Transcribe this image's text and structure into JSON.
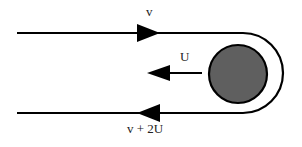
{
  "diagram": {
    "type": "flow-around-moving-body",
    "labels": {
      "top_velocity": "v",
      "body_velocity": "U",
      "bottom_velocity": "v + 2U"
    },
    "colors": {
      "stroke": "#000000",
      "body_fill": "#5f5f5f",
      "background": "#ffffff"
    },
    "elements": [
      {
        "name": "incoming-stream",
        "direction": "right",
        "label": "v"
      },
      {
        "name": "moving-body",
        "shape": "circle",
        "direction": "left",
        "label": "U"
      },
      {
        "name": "outgoing-stream",
        "direction": "left",
        "label": "v + 2U"
      }
    ]
  }
}
